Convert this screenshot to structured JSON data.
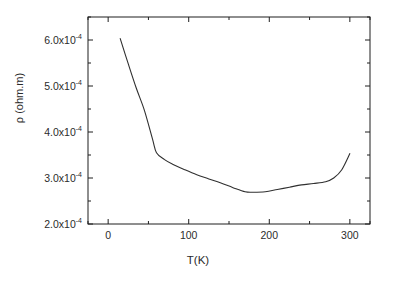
{
  "chart_data": {
    "type": "line",
    "title": "",
    "xlabel": "T(K)",
    "ylabel": "ρ (ohm.m)",
    "xlim": [
      -25,
      325
    ],
    "ylim": [
      0.0002,
      0.00065
    ],
    "grid": false,
    "legend": null,
    "x_ticks": [
      0,
      100,
      200,
      300
    ],
    "x_tick_labels": [
      "0",
      "100",
      "200",
      "300"
    ],
    "x_minor_ticks": [
      -25,
      50,
      150,
      250,
      325
    ],
    "y_ticks": [
      0.0002,
      0.0003,
      0.0004,
      0.0005,
      0.0006
    ],
    "y_tick_labels": [
      "2.0x10",
      "3.0x10",
      "4.0x10",
      "5.0x10",
      "6.0x10"
    ],
    "y_tick_exponent": "-4",
    "y_minor_ticks": [
      0.00025,
      0.00035,
      0.00045,
      0.00055,
      0.00065
    ],
    "series": [
      {
        "name": "resistivity",
        "color": "#303030",
        "x": [
          15,
          25,
          35,
          45,
          55,
          60,
          70,
          80,
          95,
          110,
          125,
          140,
          155,
          170,
          180,
          195,
          210,
          225,
          240,
          255,
          270,
          280,
          290,
          300
        ],
        "y": [
          0.000603,
          0.000548,
          0.000495,
          0.000447,
          0.000385,
          0.000355,
          0.00034,
          0.00033,
          0.000318,
          0.000307,
          0.000298,
          0.000289,
          0.000279,
          0.00027,
          0.000269,
          0.00027,
          0.000275,
          0.00028,
          0.000285,
          0.000288,
          0.000292,
          0.0003,
          0.000318,
          0.000353
        ]
      }
    ]
  },
  "axis_titles": {
    "x": "T(K)",
    "y_rho": "ρ",
    "y_units": " (ohm.m)"
  }
}
